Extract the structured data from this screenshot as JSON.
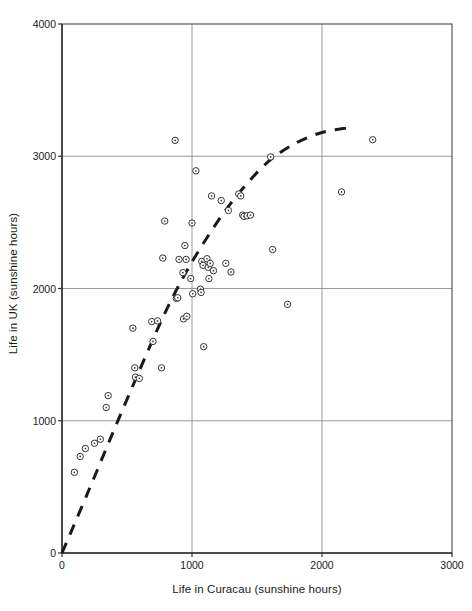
{
  "chart_data": {
    "type": "scatter",
    "title": "",
    "xlabel": "Life in Curacau (sunshine hours)",
    "ylabel": "Life in UK (sunshine hours)",
    "xlim": [
      0,
      3000
    ],
    "ylim": [
      0,
      4000
    ],
    "xticks": [
      0,
      1000,
      2000,
      3000
    ],
    "yticks": [
      0,
      1000,
      2000,
      3000,
      4000
    ],
    "xtick_labels": [
      "0",
      "1000",
      "2000",
      "3000"
    ],
    "ytick_labels": [
      "0",
      "1000",
      "2000",
      "3000",
      "4000"
    ],
    "grid": true,
    "grid_color": "#808080",
    "axis_color": "#4d4d4d",
    "marker": "circle-with-dot",
    "marker_edge_color": "#333333",
    "marker_face_color": "#ffffff",
    "legend": null,
    "series": [
      {
        "name": "observations",
        "points": [
          [
            95,
            610
          ],
          [
            140,
            730
          ],
          [
            180,
            790
          ],
          [
            250,
            830
          ],
          [
            295,
            860
          ],
          [
            355,
            1190
          ],
          [
            340,
            1100
          ],
          [
            545,
            1700
          ],
          [
            560,
            1400
          ],
          [
            565,
            1330
          ],
          [
            595,
            1320
          ],
          [
            690,
            1750
          ],
          [
            700,
            1600
          ],
          [
            735,
            1755
          ],
          [
            765,
            1400
          ],
          [
            775,
            2230
          ],
          [
            790,
            2510
          ],
          [
            870,
            3120
          ],
          [
            880,
            1925
          ],
          [
            890,
            1930
          ],
          [
            900,
            2220
          ],
          [
            930,
            2120
          ],
          [
            935,
            1770
          ],
          [
            945,
            2325
          ],
          [
            955,
            2220
          ],
          [
            960,
            1790
          ],
          [
            990,
            2075
          ],
          [
            1000,
            2495
          ],
          [
            1005,
            1960
          ],
          [
            1030,
            2890
          ],
          [
            1065,
            1995
          ],
          [
            1070,
            1970
          ],
          [
            1075,
            2205
          ],
          [
            1085,
            2175
          ],
          [
            1090,
            1560
          ],
          [
            1115,
            2225
          ],
          [
            1125,
            2160
          ],
          [
            1130,
            2075
          ],
          [
            1140,
            2190
          ],
          [
            1150,
            2700
          ],
          [
            1165,
            2135
          ],
          [
            1225,
            2665
          ],
          [
            1260,
            2190
          ],
          [
            1280,
            2590
          ],
          [
            1300,
            2125
          ],
          [
            1360,
            2715
          ],
          [
            1375,
            2700
          ],
          [
            1390,
            2555
          ],
          [
            1400,
            2545
          ],
          [
            1425,
            2550
          ],
          [
            1450,
            2555
          ],
          [
            1605,
            2995
          ],
          [
            1620,
            2295
          ],
          [
            1735,
            1880
          ],
          [
            2150,
            2730
          ],
          [
            2390,
            3125
          ]
        ]
      }
    ],
    "trend_line": {
      "style": "dashed",
      "color": "#1a1a1a",
      "width": 3,
      "description": "concave increasing curve from origin, flattening near x=2200",
      "points": [
        [
          0,
          0
        ],
        [
          200,
          460
        ],
        [
          400,
          930
        ],
        [
          600,
          1390
        ],
        [
          780,
          1790
        ],
        [
          930,
          2080
        ],
        [
          1080,
          2330
        ],
        [
          1250,
          2580
        ],
        [
          1420,
          2790
        ],
        [
          1600,
          2970
        ],
        [
          1800,
          3100
        ],
        [
          2000,
          3180
        ],
        [
          2200,
          3215
        ]
      ]
    }
  },
  "axis_titles": {
    "x": "Life in Curacau (sunshine hours)",
    "y": "Life in UK (sunshine hours)"
  }
}
